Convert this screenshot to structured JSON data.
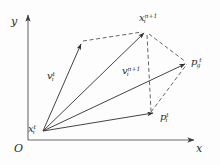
{
  "figure": {
    "type": "vector-diagram",
    "background_color": "#fdfdfd",
    "stroke_color": "#3a3a3a",
    "axis_color": "#555555",
    "axes": {
      "x_label": "x",
      "y_label": "y",
      "origin_label": "O"
    },
    "points": [
      {
        "id": "x_t",
        "label_base": "x",
        "label_sub": "i",
        "label_sup": "t",
        "x": 43,
        "y": 131
      },
      {
        "id": "x_n1",
        "label_base": "x",
        "label_sub": "i",
        "label_sup": "n+1",
        "x": 146,
        "y": 31
      },
      {
        "id": "p_g",
        "label_base": "p",
        "label_sub": "g",
        "label_sup": "t",
        "x": 187,
        "y": 63
      },
      {
        "id": "p_i",
        "label_base": "p",
        "label_sub": "i",
        "label_sup": "t",
        "x": 155,
        "y": 113
      },
      {
        "id": "v_t",
        "label_base": "v",
        "label_sub": "i",
        "label_sup": "t",
        "x": 82,
        "y": 42
      },
      {
        "id": "v_n1",
        "label_base": "v",
        "label_sub": "i",
        "label_sup": "n+1",
        "x": 146,
        "y": 113
      }
    ],
    "labels": [
      {
        "name": "label-x-i-t",
        "base": "x",
        "sub": "i",
        "sup": "t",
        "left": 28,
        "top": 119
      },
      {
        "name": "label-x-i-n1",
        "base": "x",
        "sub": "i",
        "sup": "n+1",
        "left": 140,
        "top": 9
      },
      {
        "name": "label-p-g-t",
        "base": "p",
        "sub": "g",
        "sup": "t",
        "left": 191,
        "top": 53
      },
      {
        "name": "label-p-i-t",
        "base": "p",
        "sub": "i",
        "sup": "t",
        "left": 161,
        "top": 108
      },
      {
        "name": "label-v-i-t",
        "base": "v",
        "sub": "i",
        "sup": "t",
        "left": 48,
        "top": 67
      },
      {
        "name": "label-v-i-n1",
        "base": "v",
        "sub": "i",
        "sup": "n+1",
        "left": 123,
        "top": 62
      }
    ],
    "solid_vectors": [
      {
        "name": "vector-v-i-t",
        "x1": 43,
        "y1": 131,
        "x2": 82,
        "y2": 42
      },
      {
        "name": "vector-x-to-x-next",
        "x1": 43,
        "y1": 131,
        "x2": 146,
        "y2": 31
      },
      {
        "name": "vector-x-to-p-g",
        "x1": 43,
        "y1": 131,
        "x2": 187,
        "y2": 63
      },
      {
        "name": "vector-x-to-p-i",
        "x1": 43,
        "y1": 131,
        "x2": 155,
        "y2": 113
      }
    ],
    "dashed_lines": [
      {
        "name": "dashed-v-top-to-x-next",
        "x1": 82,
        "y1": 42,
        "x2": 146,
        "y2": 31
      },
      {
        "name": "dashed-x-next-to-p-g",
        "x1": 146,
        "y1": 31,
        "x2": 187,
        "y2": 63
      },
      {
        "name": "dashed-v-n1-guide",
        "x1": 146,
        "y1": 31,
        "x2": 150,
        "y2": 113
      },
      {
        "name": "dashed-p-i-to-p-g",
        "x1": 150,
        "y1": 113,
        "x2": 187,
        "y2": 63
      }
    ],
    "axis_lines": [
      {
        "name": "y-axis",
        "x1": 28,
        "y1": 140,
        "x2": 28,
        "y2": 13
      },
      {
        "name": "x-axis",
        "x1": 28,
        "y1": 140,
        "x2": 196,
        "y2": 140
      }
    ]
  }
}
